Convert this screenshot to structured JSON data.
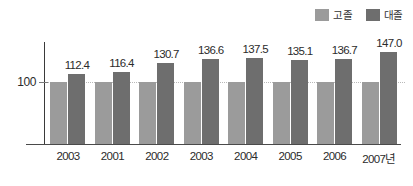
{
  "chart_data": {
    "type": "bar",
    "title": "",
    "subtitle": "",
    "xlabel": "",
    "ylabel": "",
    "categories": [
      "2003",
      "2001",
      "2002",
      "2003",
      "2004",
      "2005",
      "2006",
      "2007년"
    ],
    "series": [
      {
        "name": "고졸",
        "color": "#9b9b9b",
        "values": [
          100,
          100,
          100,
          100,
          100,
          100,
          100,
          100
        ],
        "labels": [
          "",
          "",
          "",
          "",
          "",
          "",
          "",
          ""
        ]
      },
      {
        "name": "대졸",
        "color": "#6e6e6e",
        "values": [
          112.4,
          116.4,
          130.7,
          136.6,
          137.5,
          135.1,
          136.7,
          147.0
        ],
        "labels": [
          "112.4",
          "116.4",
          "130.7",
          "136.6",
          "137.5",
          "135.1",
          "136.7",
          "147.0"
        ]
      }
    ],
    "ylim": [
      0,
      160
    ],
    "yticks": [
      100
    ],
    "ytick_labels": [
      "100"
    ],
    "grid": false,
    "reference_line": 100,
    "legend_position": "top-right",
    "annotations": []
  },
  "legend": {
    "items": [
      {
        "label": "고졸",
        "color": "#9b9b9b"
      },
      {
        "label": "대졸",
        "color": "#6e6e6e"
      }
    ]
  },
  "axis": {
    "y_label_100": "100"
  }
}
